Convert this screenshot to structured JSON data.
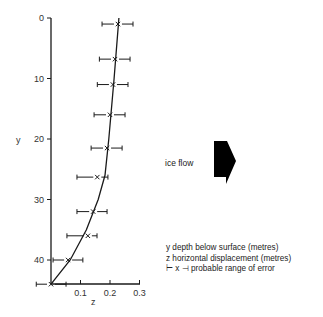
{
  "chart_data": {
    "type": "scatter",
    "title": "",
    "xlabel": "z",
    "ylabel": "y",
    "xlim": [
      0,
      0.3
    ],
    "ylim": [
      44,
      0
    ],
    "y_inverted": true,
    "x_ticks": [
      "0.1",
      "0.2",
      "0.3"
    ],
    "y_ticks": [
      "0",
      "10",
      "20",
      "30",
      "40"
    ],
    "grid": false,
    "series": [
      {
        "name": "measured displacement",
        "marker": "x",
        "points": [
          {
            "y": 1,
            "z": 0.227,
            "z_err_low": 0.173,
            "z_err_high": 0.278
          },
          {
            "y": 6.8,
            "z": 0.217,
            "z_err_low": 0.164,
            "z_err_high": 0.268
          },
          {
            "y": 11,
            "z": 0.21,
            "z_err_low": 0.157,
            "z_err_high": 0.261
          },
          {
            "y": 16,
            "z": 0.2,
            "z_err_low": 0.146,
            "z_err_high": 0.251
          },
          {
            "y": 21.5,
            "z": 0.19,
            "z_err_low": 0.136,
            "z_err_high": 0.241
          },
          {
            "y": 26.3,
            "z": 0.157,
            "z_err_low": 0.088,
            "z_err_high": 0.193
          },
          {
            "y": 32,
            "z": 0.143,
            "z_err_low": 0.088,
            "z_err_high": 0.19
          },
          {
            "y": 36,
            "z": 0.125,
            "z_err_low": 0.054,
            "z_err_high": 0.156
          },
          {
            "y": 40,
            "z": 0.058,
            "z_err_low": 0.007,
            "z_err_high": 0.108
          },
          {
            "y": 44,
            "z": 0.0,
            "z_err_low": -0.05,
            "z_err_high": 0.051
          }
        ]
      },
      {
        "name": "fitted curve",
        "type": "line",
        "points": [
          {
            "y": 0,
            "z": 0.23
          },
          {
            "y": 10,
            "z": 0.214
          },
          {
            "y": 20,
            "z": 0.196
          },
          {
            "y": 26,
            "z": 0.183
          },
          {
            "y": 30,
            "z": 0.16
          },
          {
            "y": 35,
            "z": 0.12
          },
          {
            "y": 40,
            "z": 0.065
          },
          {
            "y": 44,
            "z": 0.0
          }
        ]
      }
    ],
    "annotations": [
      "ice flow"
    ],
    "legend": [
      "y depth below surface (metres)",
      "z horizontal displacement (metres)",
      "probable range of error"
    ]
  },
  "labels": {
    "y_axis": "y",
    "x_axis": "z",
    "ice_flow": "ice flow",
    "legend_y": "y depth below surface (metres)",
    "legend_z": "z horizontal displacement (metres)",
    "legend_err_symbol": "⊢ x ⊣",
    "legend_err": "probable range of error"
  },
  "colors": {
    "ink": "#1a1a1a",
    "arrow": "#000000"
  }
}
